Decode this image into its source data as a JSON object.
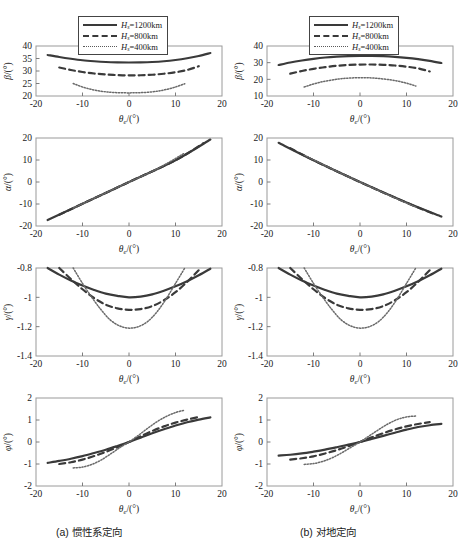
{
  "figure": {
    "captions": {
      "a": "(a) 惯性系定向",
      "b": "(b) 对地定向"
    },
    "legend": [
      {
        "style": "solid",
        "var": "H",
        "sub": "s",
        "eq": "=1200km"
      },
      {
        "style": "dash",
        "var": "H",
        "sub": "s",
        "eq": "=800km"
      },
      {
        "style": "dot",
        "var": "H",
        "sub": "s",
        "eq": "=400km"
      }
    ],
    "xlabel": {
      "var": "θ",
      "sub": "e",
      "unit": "/(°)"
    }
  },
  "chart_data": [
    {
      "id": "a-beta",
      "type": "line",
      "column": "a",
      "row": 0,
      "ylabel": {
        "var": "β",
        "unit": "/(°)"
      },
      "xlabel": {
        "var": "θ",
        "sub": "e",
        "unit": "/(°)"
      },
      "xlim": [
        -20,
        20
      ],
      "ylim": [
        20,
        40
      ],
      "xticks": [
        -20,
        -10,
        0,
        10,
        20
      ],
      "yticks": [
        20,
        25,
        30,
        35,
        40
      ],
      "grid": false,
      "legend_position": "above",
      "series": [
        {
          "name": "Hs=1200km",
          "style": "solid",
          "x": [
            -17.5,
            -15,
            -12.5,
            -10,
            -7.5,
            -5,
            -2.5,
            0,
            2.5,
            5,
            7.5,
            10,
            12.5,
            15,
            17.5
          ],
          "y": [
            36.4,
            35.6,
            34.9,
            34.3,
            33.9,
            33.6,
            33.45,
            33.4,
            33.45,
            33.6,
            33.9,
            34.4,
            35.1,
            36.0,
            37.2
          ]
        },
        {
          "name": "Hs=800km",
          "style": "dash",
          "x": [
            -15,
            -12.5,
            -10,
            -7.5,
            -5,
            -2.5,
            0,
            2.5,
            5,
            7.5,
            10,
            12.5,
            15
          ],
          "y": [
            31.4,
            30.4,
            29.6,
            29.0,
            28.6,
            28.35,
            28.25,
            28.3,
            28.5,
            28.9,
            29.5,
            30.4,
            31.9
          ]
        },
        {
          "name": "Hs=400km",
          "style": "dot",
          "x": [
            -12,
            -10,
            -8,
            -6,
            -4,
            -2,
            0,
            2,
            4,
            6,
            8,
            10,
            12
          ],
          "y": [
            25.0,
            23.6,
            22.6,
            21.9,
            21.5,
            21.3,
            21.25,
            21.3,
            21.5,
            21.9,
            22.6,
            23.6,
            24.9
          ]
        }
      ]
    },
    {
      "id": "a-alpha",
      "type": "line",
      "column": "a",
      "row": 1,
      "ylabel": {
        "var": "α",
        "unit": "/(°)"
      },
      "xlabel": {
        "var": "θ",
        "sub": "e",
        "unit": "/(°)"
      },
      "xlim": [
        -20,
        20
      ],
      "ylim": [
        -20,
        20
      ],
      "xticks": [
        -20,
        -10,
        0,
        10,
        20
      ],
      "yticks": [
        -20,
        -10,
        0,
        10,
        20
      ],
      "grid": false,
      "legend_position": "none",
      "series": [
        {
          "name": "Hs=1200km",
          "style": "solid",
          "x": [
            -17.5,
            -10,
            0,
            10,
            17.5
          ],
          "y": [
            -17.3,
            -9.9,
            0,
            9.9,
            19.3
          ]
        },
        {
          "name": "Hs=800km",
          "style": "dash",
          "x": [
            -15,
            -10,
            0,
            10,
            16
          ],
          "y": [
            -14.9,
            -9.9,
            0,
            9.9,
            17.6
          ]
        },
        {
          "name": "Hs=400km",
          "style": "dot",
          "x": [
            -12,
            -6,
            0,
            6,
            12
          ],
          "y": [
            -11.9,
            -5.9,
            0,
            5.9,
            13.2
          ]
        }
      ]
    },
    {
      "id": "a-gamma",
      "type": "line",
      "column": "a",
      "row": 2,
      "ylabel": {
        "var": "γ",
        "unit": "/(°)"
      },
      "xlabel": {
        "var": "θ",
        "sub": "e",
        "unit": "/(°)"
      },
      "xlim": [
        -20,
        20
      ],
      "ylim": [
        -1.4,
        -0.8
      ],
      "xticks": [
        -20,
        -10,
        0,
        10,
        20
      ],
      "yticks": [
        -1.4,
        -1.2,
        -1,
        -0.8
      ],
      "grid": false,
      "legend_position": "none",
      "series": [
        {
          "name": "Hs=1200km",
          "style": "solid",
          "x": [
            -17.5,
            -15,
            -12.5,
            -10,
            -7.5,
            -5,
            -2.5,
            0,
            2.5,
            5,
            7.5,
            10,
            12.5,
            15,
            17.5
          ],
          "y": [
            -0.8,
            -0.845,
            -0.885,
            -0.92,
            -0.95,
            -0.975,
            -0.99,
            -1.0,
            -0.995,
            -0.98,
            -0.955,
            -0.925,
            -0.89,
            -0.85,
            -0.805
          ]
        },
        {
          "name": "Hs=800km",
          "style": "dash",
          "x": [
            -15,
            -12.5,
            -10,
            -7.5,
            -5,
            -2.5,
            0,
            2.5,
            5,
            7.5,
            10,
            12.5,
            15
          ],
          "y": [
            -0.8,
            -0.875,
            -0.945,
            -1.005,
            -1.05,
            -1.075,
            -1.085,
            -1.08,
            -1.06,
            -1.02,
            -0.965,
            -0.895,
            -0.815
          ]
        },
        {
          "name": "Hs=400km",
          "style": "dot",
          "x": [
            -12,
            -10,
            -8,
            -6,
            -4,
            -2,
            0,
            2,
            4,
            6,
            8,
            10,
            12
          ],
          "y": [
            -0.8,
            -0.905,
            -1.0,
            -1.085,
            -1.155,
            -1.195,
            -1.21,
            -1.2,
            -1.165,
            -1.1,
            -1.01,
            -0.905,
            -0.8
          ]
        }
      ]
    },
    {
      "id": "a-phi",
      "type": "line",
      "column": "a",
      "row": 3,
      "ylabel": {
        "var": "φ",
        "unit": "/(°)"
      },
      "xlabel": {
        "var": "θ",
        "sub": "e",
        "unit": "/(°)"
      },
      "xlim": [
        -20,
        20
      ],
      "ylim": [
        -2,
        2
      ],
      "xticks": [
        -20,
        -10,
        0,
        10,
        20
      ],
      "yticks": [
        -2,
        -1,
        0,
        1,
        2
      ],
      "grid": false,
      "legend_position": "none",
      "series": [
        {
          "name": "Hs=1200km",
          "style": "solid",
          "x": [
            -17.5,
            -15,
            -12.5,
            -10,
            -7.5,
            -5,
            -2.5,
            0,
            2.5,
            5,
            7.5,
            10,
            12.5,
            15,
            17.5
          ],
          "y": [
            -0.95,
            -0.86,
            -0.76,
            -0.64,
            -0.5,
            -0.35,
            -0.18,
            0.0,
            0.2,
            0.4,
            0.58,
            0.75,
            0.9,
            1.02,
            1.12
          ]
        },
        {
          "name": "Hs=800km",
          "style": "dash",
          "x": [
            -15,
            -12.5,
            -10,
            -7.5,
            -5,
            -2.5,
            0,
            2.5,
            5,
            7.5,
            10,
            12.5,
            15
          ],
          "y": [
            -1.0,
            -0.92,
            -0.8,
            -0.64,
            -0.45,
            -0.24,
            0.0,
            0.26,
            0.5,
            0.71,
            0.88,
            1.02,
            1.14
          ]
        },
        {
          "name": "Hs=400km",
          "style": "dot",
          "x": [
            -12,
            -10,
            -8,
            -6,
            -4,
            -2,
            0,
            2,
            4,
            6,
            8,
            10,
            12
          ],
          "y": [
            -1.18,
            -1.14,
            -1.02,
            -0.82,
            -0.55,
            -0.26,
            0.0,
            0.3,
            0.62,
            0.92,
            1.16,
            1.34,
            1.45
          ]
        }
      ]
    },
    {
      "id": "b-beta",
      "type": "line",
      "column": "b",
      "row": 0,
      "ylabel": {
        "var": "β",
        "unit": "/(°)"
      },
      "xlabel": {
        "var": "θ",
        "sub": "e",
        "unit": "/(°)"
      },
      "xlim": [
        -20,
        20
      ],
      "ylim": [
        10,
        40
      ],
      "xticks": [
        -20,
        -10,
        0,
        10,
        20
      ],
      "yticks": [
        10,
        20,
        30,
        40
      ],
      "grid": false,
      "legend_position": "above",
      "series": [
        {
          "name": "Hs=1200km",
          "style": "solid",
          "x": [
            -17.5,
            -15,
            -12.5,
            -10,
            -7.5,
            -5,
            -2.5,
            0,
            2.5,
            5,
            7.5,
            10,
            12.5,
            15,
            17.5
          ],
          "y": [
            28.6,
            30.1,
            31.3,
            32.3,
            33.1,
            33.6,
            33.9,
            34.05,
            34.1,
            33.9,
            33.5,
            32.9,
            32.1,
            31.1,
            29.8
          ]
        },
        {
          "name": "Hs=800km",
          "style": "dash",
          "x": [
            -15,
            -12.5,
            -10,
            -7.5,
            -5,
            -2.5,
            0,
            2.5,
            5,
            7.5,
            10,
            12.5,
            15
          ],
          "y": [
            23.4,
            25.0,
            26.3,
            27.3,
            28.1,
            28.6,
            28.85,
            28.9,
            28.7,
            28.3,
            27.6,
            26.6,
            24.7
          ]
        },
        {
          "name": "Hs=400km",
          "style": "dot",
          "x": [
            -12,
            -10,
            -8,
            -6,
            -4,
            -2,
            0,
            2,
            4,
            6,
            8,
            10,
            12
          ],
          "y": [
            15.4,
            17.2,
            18.6,
            19.6,
            20.4,
            20.8,
            21.0,
            20.9,
            20.5,
            19.9,
            19.0,
            17.7,
            16.0
          ]
        }
      ]
    },
    {
      "id": "b-alpha",
      "type": "line",
      "column": "b",
      "row": 1,
      "ylabel": {
        "var": "α",
        "unit": "/(°)"
      },
      "xlabel": {
        "var": "θ",
        "sub": "e",
        "unit": "/(°)"
      },
      "xlim": [
        -20,
        20
      ],
      "ylim": [
        -20,
        20
      ],
      "xticks": [
        -20,
        -10,
        0,
        10,
        20
      ],
      "yticks": [
        -20,
        -10,
        0,
        10,
        20
      ],
      "grid": false,
      "legend_position": "none",
      "series": [
        {
          "name": "Hs=1200km",
          "style": "solid",
          "x": [
            -17.5,
            -10,
            0,
            10,
            17.5
          ],
          "y": [
            17.8,
            9.9,
            0,
            -9.3,
            -15.7
          ]
        },
        {
          "name": "Hs=800km",
          "style": "dash",
          "x": [
            -15,
            -10,
            0,
            10,
            16
          ],
          "y": [
            15.4,
            9.9,
            0,
            -9.4,
            -14.6
          ]
        },
        {
          "name": "Hs=400km",
          "style": "dot",
          "x": [
            -12,
            -6,
            0,
            6,
            12
          ],
          "y": [
            12.2,
            5.9,
            0,
            -5.8,
            -11.4
          ]
        }
      ]
    },
    {
      "id": "b-gamma",
      "type": "line",
      "column": "b",
      "row": 2,
      "ylabel": {
        "var": "γ",
        "unit": "/(°)"
      },
      "xlabel": {
        "var": "θ",
        "sub": "e",
        "unit": "/(°)"
      },
      "xlim": [
        -20,
        20
      ],
      "ylim": [
        -1.4,
        -0.8
      ],
      "xticks": [
        -20,
        -10,
        0,
        10,
        20
      ],
      "yticks": [
        -1.4,
        -1.2,
        -1,
        -0.8
      ],
      "grid": false,
      "legend_position": "none",
      "series": [
        {
          "name": "Hs=1200km",
          "style": "solid",
          "x": [
            -17.5,
            -15,
            -12.5,
            -10,
            -7.5,
            -5,
            -2.5,
            0,
            2.5,
            5,
            7.5,
            10,
            12.5,
            15,
            17.5
          ],
          "y": [
            -0.8,
            -0.845,
            -0.885,
            -0.92,
            -0.95,
            -0.975,
            -0.99,
            -1.0,
            -0.995,
            -0.98,
            -0.955,
            -0.925,
            -0.89,
            -0.85,
            -0.805
          ]
        },
        {
          "name": "Hs=800km",
          "style": "dash",
          "x": [
            -15,
            -12.5,
            -10,
            -7.5,
            -5,
            -2.5,
            0,
            2.5,
            5,
            7.5,
            10,
            12.5,
            15
          ],
          "y": [
            -0.8,
            -0.875,
            -0.945,
            -1.005,
            -1.05,
            -1.075,
            -1.085,
            -1.08,
            -1.06,
            -1.02,
            -0.965,
            -0.895,
            -0.815
          ]
        },
        {
          "name": "Hs=400km",
          "style": "dot",
          "x": [
            -12,
            -10,
            -8,
            -6,
            -4,
            -2,
            0,
            2,
            4,
            6,
            8,
            10,
            12
          ],
          "y": [
            -0.8,
            -0.905,
            -1.0,
            -1.085,
            -1.155,
            -1.195,
            -1.21,
            -1.2,
            -1.165,
            -1.1,
            -1.01,
            -0.905,
            -0.8
          ]
        }
      ]
    },
    {
      "id": "b-phi",
      "type": "line",
      "column": "b",
      "row": 3,
      "ylabel": {
        "var": "φ",
        "unit": "/(°)"
      },
      "xlabel": {
        "var": "θ",
        "sub": "e",
        "unit": "/(°)"
      },
      "xlim": [
        -20,
        20
      ],
      "ylim": [
        -2,
        2
      ],
      "xticks": [
        -20,
        -10,
        0,
        10,
        20
      ],
      "yticks": [
        -2,
        -1,
        0,
        1,
        2
      ],
      "grid": false,
      "legend_position": "none",
      "series": [
        {
          "name": "Hs=1200km",
          "style": "solid",
          "x": [
            -17.5,
            -15,
            -12.5,
            -10,
            -7.5,
            -5,
            -2.5,
            0,
            2.5,
            5,
            7.5,
            10,
            12.5,
            15,
            17.5
          ],
          "y": [
            -0.62,
            -0.58,
            -0.52,
            -0.44,
            -0.35,
            -0.24,
            -0.12,
            0.0,
            0.14,
            0.28,
            0.42,
            0.56,
            0.68,
            0.76,
            0.82
          ]
        },
        {
          "name": "Hs=800km",
          "style": "dash",
          "x": [
            -15,
            -12.5,
            -10,
            -7.5,
            -5,
            -2.5,
            0,
            2.5,
            5,
            7.5,
            10,
            12.5,
            15
          ],
          "y": [
            -0.8,
            -0.74,
            -0.65,
            -0.52,
            -0.37,
            -0.19,
            0.0,
            0.21,
            0.4,
            0.57,
            0.71,
            0.82,
            0.9
          ]
        },
        {
          "name": "Hs=400km",
          "style": "dot",
          "x": [
            -12,
            -10,
            -8,
            -6,
            -4,
            -2,
            0,
            2,
            4,
            6,
            8,
            10,
            12
          ],
          "y": [
            -1.02,
            -0.98,
            -0.88,
            -0.72,
            -0.5,
            -0.25,
            0.0,
            0.28,
            0.56,
            0.82,
            1.02,
            1.14,
            1.18
          ]
        }
      ]
    }
  ]
}
